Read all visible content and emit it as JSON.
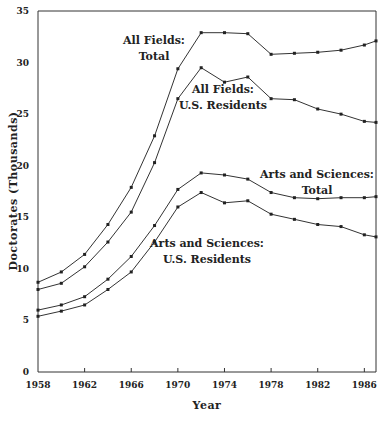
{
  "chart_data": {
    "type": "line",
    "title": "",
    "xlabel": "Year",
    "ylabel": "Doctorates (Thousands)",
    "xlim": [
      1958,
      1987
    ],
    "ylim": [
      0,
      35
    ],
    "grid": false,
    "legend": "inline labels",
    "x_ticks": [
      1958,
      1962,
      1966,
      1970,
      1974,
      1978,
      1982,
      1986
    ],
    "x_tick_labels": [
      "1958",
      "1962",
      "1966",
      "1970",
      "1974",
      "1978",
      "1982",
      "1986"
    ],
    "y_ticks": [
      0,
      5,
      10,
      15,
      20,
      25,
      30,
      35
    ],
    "y_tick_labels": [
      "0",
      "5",
      "10",
      "15",
      "20",
      "25",
      "30",
      "35"
    ],
    "x": [
      1958,
      1960,
      1962,
      1964,
      1966,
      1968,
      1970,
      1972,
      1974,
      1976,
      1978,
      1980,
      1982,
      1984,
      1986,
      1987
    ],
    "series": [
      {
        "name": "All Fields: Total",
        "label_lines": [
          "All Fields:",
          "Total"
        ],
        "label_pos": [
          154,
          44
        ],
        "values": [
          8.7,
          9.7,
          11.4,
          14.3,
          17.9,
          22.9,
          29.4,
          32.9,
          32.9,
          32.8,
          30.8,
          30.9,
          31.0,
          31.2,
          31.7,
          32.1
        ]
      },
      {
        "name": "All Fields: U.S. Residents",
        "label_lines": [
          "All Fields:",
          "U.S. Residents"
        ],
        "label_pos": [
          223,
          93
        ],
        "values": [
          8.0,
          8.6,
          10.2,
          12.6,
          15.5,
          20.3,
          26.5,
          29.5,
          28.1,
          28.6,
          26.5,
          26.4,
          25.5,
          25.0,
          24.3,
          24.2
        ]
      },
      {
        "name": "Arts and Sciences: Total",
        "label_lines": [
          "Arts and Sciences:",
          "Total"
        ],
        "label_pos": [
          317,
          178
        ],
        "values": [
          6.0,
          6.5,
          7.3,
          9.0,
          11.2,
          14.2,
          17.7,
          19.3,
          19.1,
          18.7,
          17.4,
          16.9,
          16.8,
          16.9,
          16.9,
          17.0
        ]
      },
      {
        "name": "Arts and Sciences: U.S. Residents",
        "label_lines": [
          "Arts and Sciences:",
          "U.S. Residents"
        ],
        "label_pos": [
          207,
          247
        ],
        "values": [
          5.4,
          5.9,
          6.5,
          8.0,
          9.7,
          12.6,
          16.0,
          17.4,
          16.4,
          16.6,
          15.3,
          14.8,
          14.3,
          14.1,
          13.3,
          13.1
        ]
      }
    ]
  }
}
